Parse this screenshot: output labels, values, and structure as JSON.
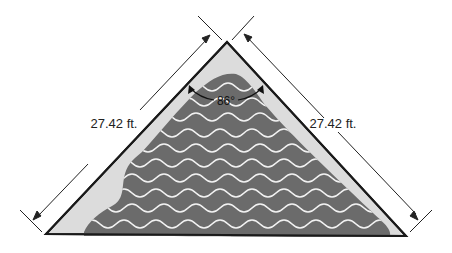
{
  "diagram": {
    "shape": "isosceles-triangle",
    "colors": {
      "deck": "#dcdcdc",
      "outline": "#1a1a1a",
      "water": "#6b6b6b",
      "waves": "#f2f2f2",
      "dimension_lines": "#222222"
    },
    "left_side": {
      "length_label": "27.42 ft."
    },
    "right_side": {
      "length_label": "27.42 ft."
    },
    "apex_angle": {
      "label": "86°"
    }
  }
}
